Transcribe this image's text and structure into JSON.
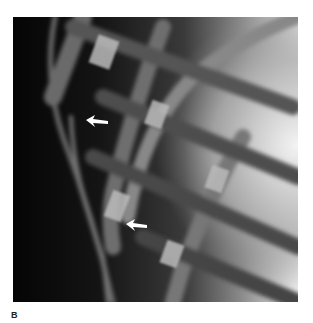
{
  "figure": {
    "panel_label": "B",
    "image_description": "Grayscale radiograph of the lateral chest wall showing overlapping ribs",
    "annotations": [
      {
        "type": "arrow",
        "direction": "left",
        "color": "#ffffff"
      },
      {
        "type": "arrow",
        "direction": "left",
        "color": "#ffffff"
      }
    ]
  }
}
